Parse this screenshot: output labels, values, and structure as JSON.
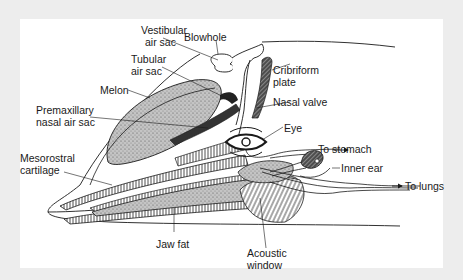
{
  "figure": {
    "colors": {
      "frame_background": "#ededed",
      "panel_background": "#ffffff",
      "line": "#1a1a1a",
      "stipple_fill": "#b8b8b8",
      "dark_fill": "#3a3a3a"
    }
  },
  "labels": {
    "vestibular_air_sac": {
      "line1": "Vestibular",
      "line2": "air sac"
    },
    "blowhole": {
      "text": "Blowhole"
    },
    "tubular_air_sac": {
      "line1": "Tubular",
      "line2": "air sac"
    },
    "cribriform_plate": {
      "line1": "Cribriform",
      "line2": "plate"
    },
    "melon": {
      "text": "Melon"
    },
    "nasal_valve": {
      "text": "Nasal valve"
    },
    "premaxillary_nasal_air_sac": {
      "line1": "Premaxillary",
      "line2": "nasal air sac"
    },
    "eye": {
      "text": "Eye"
    },
    "to_stomach": {
      "text": "To stomach"
    },
    "inner_ear": {
      "text": "Inner ear"
    },
    "mesorostral_cartilage": {
      "line1": "Mesorostral",
      "line2": "cartilage"
    },
    "to_lungs": {
      "text": "To lungs"
    },
    "jaw_fat": {
      "text": "Jaw fat"
    },
    "acoustic_window": {
      "line1": "Acoustic",
      "line2": "window"
    }
  }
}
